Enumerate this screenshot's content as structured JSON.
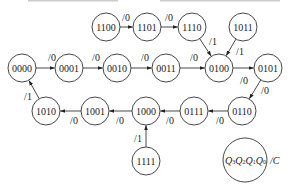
{
  "diagram": {
    "type": "state-transition-diagram",
    "nodes": [
      {
        "id": "1100",
        "label": "1100",
        "x": 106,
        "y": 27
      },
      {
        "id": "1101",
        "label": "1101",
        "x": 147,
        "y": 27
      },
      {
        "id": "1110",
        "label": "1110",
        "x": 192,
        "y": 27
      },
      {
        "id": "1011",
        "label": "1011",
        "x": 243,
        "y": 27
      },
      {
        "id": "0000",
        "label": "0000",
        "x": 22,
        "y": 68
      },
      {
        "id": "0001",
        "label": "0001",
        "x": 69,
        "y": 68
      },
      {
        "id": "0010",
        "label": "0010",
        "x": 117,
        "y": 68
      },
      {
        "id": "0011",
        "label": "0011",
        "x": 166,
        "y": 68
      },
      {
        "id": "0100",
        "label": "0100",
        "x": 219,
        "y": 68
      },
      {
        "id": "0101",
        "label": "0101",
        "x": 268,
        "y": 68
      },
      {
        "id": "1010",
        "label": "1010",
        "x": 46,
        "y": 111
      },
      {
        "id": "1001",
        "label": "1001",
        "x": 95,
        "y": 111
      },
      {
        "id": "1000",
        "label": "1000",
        "x": 146,
        "y": 111
      },
      {
        "id": "0111",
        "label": "0111",
        "x": 194,
        "y": 111
      },
      {
        "id": "0110",
        "label": "0110",
        "x": 242,
        "y": 111
      },
      {
        "id": "1111",
        "label": "1111",
        "x": 146,
        "y": 161
      }
    ],
    "node_radius": 14,
    "edges": [
      {
        "from": "1100",
        "to": "1101",
        "label": "/0",
        "lx": 126,
        "ly": 17
      },
      {
        "from": "1101",
        "to": "1110",
        "label": "/0",
        "lx": 169,
        "ly": 17
      },
      {
        "from": "1110",
        "to": "0100",
        "label": "/1",
        "lx": 213,
        "ly": 41
      },
      {
        "from": "1011",
        "to": "0100",
        "label": "/1",
        "lx": 240,
        "ly": 51
      },
      {
        "from": "0000",
        "to": "0001",
        "label": "/0",
        "lx": 52,
        "ly": 57
      },
      {
        "from": "0001",
        "to": "0010",
        "label": "/0",
        "lx": 96,
        "ly": 57
      },
      {
        "from": "0010",
        "to": "0011",
        "label": "/0",
        "lx": 145,
        "ly": 57
      },
      {
        "from": "0011",
        "to": "0100",
        "label": "/0",
        "lx": 194,
        "ly": 57
      },
      {
        "from": "0100",
        "to": "0101",
        "label": "/0",
        "lx": 244,
        "ly": 80
      },
      {
        "from": "0101",
        "to": "0110",
        "label": "/0",
        "lx": 265,
        "ly": 90
      },
      {
        "from": "0110",
        "to": "0111",
        "label": "/0",
        "lx": 220,
        "ly": 120
      },
      {
        "from": "0111",
        "to": "1000",
        "label": "/0",
        "lx": 170,
        "ly": 120
      },
      {
        "from": "1000",
        "to": "1001",
        "label": "/0",
        "lx": 120,
        "ly": 120
      },
      {
        "from": "1001",
        "to": "1010",
        "label": "/0",
        "lx": 74,
        "ly": 120
      },
      {
        "from": "1010",
        "to": "0000",
        "label": "/1",
        "lx": 28,
        "ly": 96
      },
      {
        "from": "1111",
        "to": "1000",
        "label": "/1",
        "lx": 138,
        "ly": 138
      }
    ],
    "legend": {
      "x": 245,
      "y": 160,
      "r": 22,
      "state_vars": [
        "Q",
        "3",
        "Q",
        "2",
        "Q",
        "1",
        "Q",
        "0"
      ],
      "output_label": "/C"
    }
  }
}
